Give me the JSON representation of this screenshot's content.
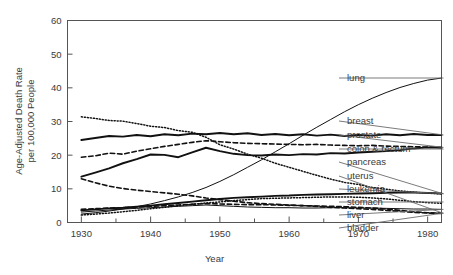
{
  "chart_data": {
    "type": "line",
    "title": "",
    "xlabel": "Year",
    "ylabel": "Age-Adjusted Death Rate per 100,000 People",
    "ylabel_line1": "Age-Adjusted Death Rate",
    "ylabel_line2": "per 100,000 People",
    "xlim": [
      1928,
      1982
    ],
    "ylim": [
      0,
      60
    ],
    "yticks": [
      0,
      10,
      20,
      30,
      40,
      50,
      60
    ],
    "ytick_labels": [
      "0",
      "10",
      "20",
      "30",
      "40",
      "50",
      "60"
    ],
    "xticks_major": [
      1930,
      1940,
      1950,
      1960,
      1970,
      1980
    ],
    "xtick_labels": [
      "1930",
      "1940",
      "1950",
      "1960",
      "1970",
      "1980"
    ],
    "xticks_minor": [
      1935,
      1945,
      1955,
      1965,
      1975
    ],
    "grid": false,
    "legend_position": "right-outside",
    "series": [
      {
        "name": "lung",
        "style": "thin-solid",
        "label_y": 78,
        "x": [
          1930,
          1932,
          1934,
          1936,
          1938,
          1940,
          1942,
          1944,
          1946,
          1948,
          1950,
          1952,
          1954,
          1956,
          1958,
          1960,
          1962,
          1964,
          1966,
          1968,
          1970,
          1972,
          1974,
          1976,
          1978,
          1980,
          1982
        ],
        "values": [
          2.5,
          2.9,
          3.4,
          4.0,
          4.7,
          5.5,
          6.5,
          7.6,
          8.9,
          10.4,
          12.2,
          14.2,
          16.4,
          18.6,
          21.0,
          23.4,
          25.9,
          28.3,
          30.6,
          32.9,
          35.0,
          36.9,
          38.6,
          40.1,
          41.3,
          42.3,
          42.9
        ]
      },
      {
        "name": "breast",
        "style": "thick-solid",
        "label_y": 121,
        "x": [
          1930,
          1932,
          1934,
          1936,
          1938,
          1940,
          1942,
          1944,
          1946,
          1948,
          1950,
          1952,
          1954,
          1956,
          1958,
          1960,
          1962,
          1964,
          1966,
          1968,
          1970,
          1972,
          1974,
          1976,
          1978,
          1980,
          1982
        ],
        "values": [
          24.5,
          25.1,
          25.7,
          25.5,
          26.0,
          25.6,
          26.2,
          25.9,
          26.4,
          26.2,
          26.6,
          26.2,
          26.5,
          26.0,
          26.3,
          25.9,
          26.2,
          25.8,
          26.1,
          25.7,
          26.0,
          25.8,
          26.2,
          25.9,
          26.3,
          26.0,
          26.0
        ]
      },
      {
        "name": "prostate",
        "style": "dash",
        "label_y": 135,
        "x": [
          1930,
          1932,
          1934,
          1936,
          1938,
          1940,
          1942,
          1944,
          1946,
          1948,
          1950,
          1952,
          1954,
          1956,
          1958,
          1960,
          1962,
          1964,
          1966,
          1968,
          1970,
          1972,
          1974,
          1976,
          1978,
          1980,
          1982
        ],
        "values": [
          19.4,
          19.8,
          20.6,
          20.3,
          21.2,
          21.9,
          22.6,
          23.2,
          23.8,
          24.3,
          24.0,
          23.7,
          23.5,
          23.4,
          23.3,
          23.2,
          23.1,
          23.2,
          23.0,
          22.9,
          22.8,
          22.9,
          22.7,
          22.6,
          22.5,
          22.4,
          22.3
        ]
      },
      {
        "name": "colon & rectum",
        "style": "thick-solid",
        "label_y": 149,
        "x": [
          1930,
          1932,
          1934,
          1936,
          1938,
          1940,
          1942,
          1944,
          1946,
          1948,
          1950,
          1952,
          1954,
          1956,
          1958,
          1960,
          1962,
          1964,
          1966,
          1968,
          1970,
          1972,
          1974,
          1976,
          1978,
          1980,
          1982
        ],
        "values": [
          13.6,
          14.8,
          16.1,
          17.6,
          18.8,
          20.2,
          20.1,
          19.4,
          20.8,
          22.2,
          21.2,
          20.4,
          20.0,
          19.9,
          20.2,
          20.0,
          20.3,
          20.2,
          20.6,
          20.5,
          20.8,
          21.0,
          21.2,
          21.5,
          22.0,
          22.3,
          22.2
        ]
      },
      {
        "name": "pancreas",
        "style": "dot",
        "label_y": 162,
        "x": [
          1930,
          1932,
          1934,
          1936,
          1938,
          1940,
          1942,
          1944,
          1946,
          1948,
          1950,
          1952,
          1954,
          1956,
          1958,
          1960,
          1962,
          1964,
          1966,
          1968,
          1970,
          1972,
          1974,
          1976,
          1978,
          1980,
          1982
        ],
        "values": [
          31.4,
          30.9,
          30.3,
          30.1,
          29.4,
          28.6,
          28.2,
          27.3,
          26.8,
          25.3,
          23.1,
          21.8,
          20.3,
          19.1,
          17.6,
          16.4,
          15.2,
          14.0,
          12.9,
          11.9,
          11.3,
          10.4,
          9.9,
          9.4,
          9.0,
          8.7,
          8.5
        ]
      },
      {
        "name": "uterus",
        "style": "dash",
        "label_y": 176,
        "x": [
          1930,
          1932,
          1934,
          1936,
          1938,
          1940,
          1942,
          1944,
          1946,
          1948,
          1950,
          1952,
          1954,
          1956,
          1958,
          1960,
          1962,
          1964,
          1966,
          1968,
          1970,
          1972,
          1974,
          1976,
          1978,
          1980,
          1982
        ],
        "values": [
          13.0,
          11.8,
          10.8,
          10.1,
          9.6,
          9.2,
          8.8,
          8.4,
          7.9,
          7.3,
          6.8,
          6.3,
          5.9,
          5.6,
          5.4,
          5.2,
          5.0,
          4.8,
          4.5,
          4.3,
          4.1,
          3.9,
          3.6,
          3.3,
          3.0,
          2.8,
          2.7
        ]
      },
      {
        "name": "leukemia",
        "style": "thick-solid",
        "label_y": 189,
        "x": [
          1930,
          1932,
          1934,
          1936,
          1938,
          1940,
          1942,
          1944,
          1946,
          1948,
          1950,
          1952,
          1954,
          1956,
          1958,
          1960,
          1962,
          1964,
          1966,
          1968,
          1970,
          1972,
          1974,
          1976,
          1978,
          1980,
          1982
        ],
        "values": [
          3.6,
          3.9,
          4.2,
          4.4,
          4.7,
          5.0,
          5.4,
          5.8,
          6.2,
          6.6,
          7.0,
          7.3,
          7.5,
          7.7,
          7.9,
          8.0,
          8.2,
          8.3,
          8.4,
          8.5,
          8.6,
          8.7,
          8.8,
          8.9,
          8.9,
          8.8,
          8.6
        ]
      },
      {
        "name": "stomach",
        "style": "dot",
        "label_y": 202,
        "x": [
          1930,
          1932,
          1934,
          1936,
          1938,
          1940,
          1942,
          1944,
          1946,
          1948,
          1950,
          1952,
          1954,
          1956,
          1958,
          1960,
          1962,
          1964,
          1966,
          1968,
          1970,
          1972,
          1974,
          1976,
          1978,
          1980,
          1982
        ],
        "values": [
          2.2,
          2.5,
          2.8,
          3.2,
          3.6,
          4.1,
          4.5,
          5.0,
          5.4,
          5.8,
          6.1,
          6.5,
          6.8,
          7.1,
          7.2,
          7.3,
          7.4,
          7.5,
          7.6,
          7.6,
          7.5,
          7.3,
          7.0,
          6.6,
          6.2,
          5.9,
          5.7
        ]
      },
      {
        "name": "liver",
        "style": "thin-solid",
        "label_y": 215,
        "x": [
          1930,
          1932,
          1934,
          1936,
          1938,
          1940,
          1942,
          1944,
          1946,
          1948,
          1950,
          1952,
          1954,
          1956,
          1958,
          1960,
          1962,
          1964,
          1966,
          1968,
          1970,
          1972,
          1974,
          1976,
          1978,
          1980,
          1982
        ],
        "values": [
          3.1,
          3.4,
          3.7,
          4.0,
          4.2,
          4.4,
          4.6,
          4.8,
          5.0,
          5.2,
          5.0,
          4.8,
          4.6,
          4.5,
          4.4,
          4.4,
          4.3,
          4.3,
          4.4,
          4.4,
          4.3,
          4.3,
          4.2,
          4.1,
          4.0,
          4.0,
          3.9
        ]
      },
      {
        "name": "bladder",
        "style": "dash",
        "label_y": 228,
        "x": [
          1930,
          1932,
          1934,
          1936,
          1938,
          1940,
          1942,
          1944,
          1946,
          1948,
          1950,
          1952,
          1954,
          1956,
          1958,
          1960,
          1962,
          1964,
          1966,
          1968,
          1970,
          1972,
          1974,
          1976,
          1978,
          1980,
          1982
        ],
        "values": [
          3.9,
          4.1,
          4.3,
          4.4,
          4.6,
          4.8,
          5.0,
          5.2,
          5.4,
          5.6,
          5.5,
          5.4,
          5.3,
          5.3,
          5.2,
          5.1,
          5.0,
          4.9,
          4.8,
          4.7,
          4.5,
          4.3,
          4.0,
          3.6,
          3.2,
          2.9,
          2.8
        ]
      }
    ]
  }
}
